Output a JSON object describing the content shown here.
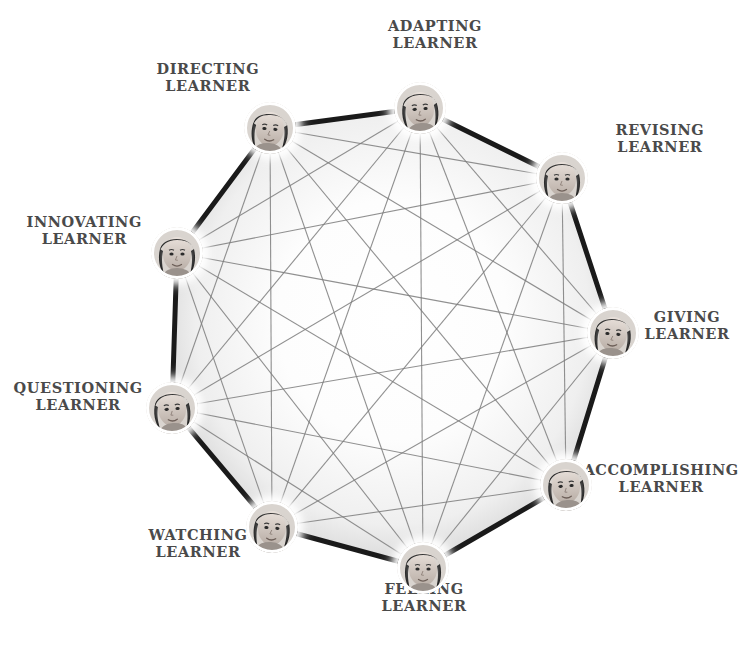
{
  "diagram": {
    "shape": "nonagon",
    "node_count": 9,
    "center": {
      "x": 420,
      "y": 323
    },
    "radius": 250,
    "colors": {
      "label_text": "#4a4a4a",
      "polygon_edge": "#1a1a1a",
      "chord_line": "#7d7d7d",
      "background": "#ffffff",
      "ring": "#ffffff"
    },
    "nodes": [
      {
        "id": "adapting",
        "label_line1": "ADAPTING",
        "label_line2": "LEARNER",
        "vertex": {
          "x": 420,
          "y": 108
        },
        "label_pos": {
          "x": 435,
          "y": 34
        },
        "label_anchor": "center",
        "icon": "learner-portrait"
      },
      {
        "id": "revising",
        "label_line1": "REVISING",
        "label_line2": "LEARNER",
        "vertex": {
          "x": 562,
          "y": 178
        },
        "label_pos": {
          "x": 660,
          "y": 138
        },
        "label_anchor": "center",
        "icon": "learner-portrait"
      },
      {
        "id": "giving",
        "label_line1": "GIVING",
        "label_line2": "LEARNER",
        "vertex": {
          "x": 613,
          "y": 333
        },
        "label_pos": {
          "x": 687,
          "y": 325
        },
        "label_anchor": "center",
        "icon": "learner-portrait"
      },
      {
        "id": "accomplishing",
        "label_line1": "ACCOMPLISHING",
        "label_line2": "LEARNER",
        "vertex": {
          "x": 566,
          "y": 485
        },
        "label_pos": {
          "x": 661,
          "y": 478
        },
        "label_anchor": "center",
        "icon": "learner-portrait"
      },
      {
        "id": "feeling",
        "label_line1": "FEELING",
        "label_line2": "LEARNER",
        "vertex": {
          "x": 423,
          "y": 568
        },
        "label_pos": {
          "x": 424,
          "y": 597
        },
        "label_anchor": "center",
        "icon": "learner-portrait"
      },
      {
        "id": "watching",
        "label_line1": "WATCHING",
        "label_line2": "LEARNER",
        "vertex": {
          "x": 272,
          "y": 527
        },
        "label_pos": {
          "x": 198,
          "y": 543
        },
        "label_anchor": "center",
        "icon": "learner-portrait"
      },
      {
        "id": "questioning",
        "label_line1": "QUESTIONING",
        "label_line2": "LEARNER",
        "vertex": {
          "x": 172,
          "y": 408
        },
        "label_pos": {
          "x": 78,
          "y": 396
        },
        "label_anchor": "center",
        "icon": "learner-portrait"
      },
      {
        "id": "innovating",
        "label_line1": "INNOVATING",
        "label_line2": "LEARNER",
        "vertex": {
          "x": 177,
          "y": 253
        },
        "label_pos": {
          "x": 84,
          "y": 230
        },
        "label_anchor": "center",
        "icon": "learner-portrait"
      },
      {
        "id": "directing",
        "label_line1": "DIRECTING",
        "label_line2": "LEARNER",
        "vertex": {
          "x": 270,
          "y": 128
        },
        "label_pos": {
          "x": 208,
          "y": 77
        },
        "label_anchor": "center",
        "icon": "learner-portrait"
      }
    ]
  }
}
